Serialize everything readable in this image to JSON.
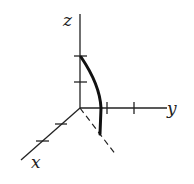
{
  "diagram": {
    "type": "3d-axes-sketch",
    "axes": {
      "z": {
        "label": "z"
      },
      "y": {
        "label": "y"
      },
      "x": {
        "label": "x"
      }
    },
    "ticks": {
      "z": 2,
      "y": 2,
      "x": 2
    },
    "curve": {
      "description": "thick arc from z-axis tick down to below y-axis, ending on dashed projection"
    },
    "projection_line": {
      "style": "dashed"
    },
    "colors": {
      "line": "#222222",
      "background": "#ffffff"
    }
  }
}
